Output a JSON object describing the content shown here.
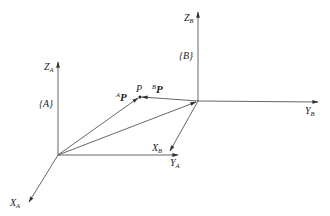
{
  "diagram": {
    "type": "coordinate-frames",
    "frame_A": {
      "name": "{A}",
      "label_brace": "{A}",
      "axes": {
        "x": "X",
        "y": "Y",
        "z": "Z",
        "subscript": "A"
      },
      "origin": [
        58,
        155
      ]
    },
    "frame_B": {
      "name": "{B}",
      "label_brace": "{B}",
      "axes": {
        "x": "X",
        "y": "Y",
        "z": "Z",
        "subscript": "B"
      },
      "origin": [
        198,
        101
      ]
    },
    "point": {
      "name": "P",
      "position": [
        140,
        97
      ]
    },
    "vectors": {
      "AP": {
        "prefix": "A",
        "symbol": "P"
      },
      "BP": {
        "prefix": "B",
        "symbol": "P"
      },
      "AtoB": "origin A to origin B"
    },
    "colors": {
      "line": "#555555",
      "text": "#222222",
      "background": "#ffffff"
    }
  }
}
